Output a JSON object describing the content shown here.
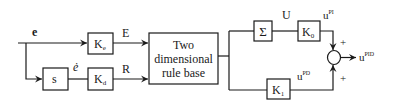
{
  "diagram": {
    "input_signal": "e",
    "derivative_signal": "ė",
    "blocks": {
      "ke": {
        "main": "K",
        "sub": "e"
      },
      "kd": {
        "main": "K",
        "sub": "d"
      },
      "s": {
        "label": "s"
      },
      "rule_base": {
        "lines": [
          "Two",
          "dimensional",
          "rule base"
        ]
      },
      "sigma": {
        "label": "Σ"
      },
      "k0": {
        "main": "K",
        "sub": "0"
      },
      "k1": {
        "main": "K",
        "sub": "1"
      }
    },
    "signals": {
      "E": "E",
      "R": "R",
      "U": "U",
      "u_pi": {
        "base": "u",
        "sup": "PI"
      },
      "u_pd": {
        "base": "u",
        "sup": "PD"
      },
      "u_pid": {
        "base": "u",
        "sup": "PID"
      }
    },
    "summer_signs": [
      "+",
      "+"
    ]
  }
}
